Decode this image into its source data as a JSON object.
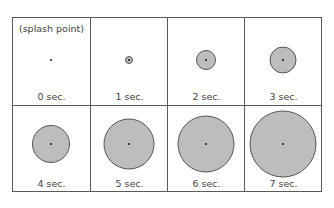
{
  "title_note": "(splash point)",
  "colors": {
    "circle_fill": "#bdbdbd",
    "border": "#5a5a5a",
    "dot": "#111111"
  },
  "cells": [
    {
      "label": "0 sec.",
      "diameter": 0
    },
    {
      "label": "1 sec.",
      "diameter": 8
    },
    {
      "label": "2 sec.",
      "diameter": 20
    },
    {
      "label": "3 sec.",
      "diameter": 27
    },
    {
      "label": "4 sec.",
      "diameter": 38
    },
    {
      "label": "5 sec.",
      "diameter": 51
    },
    {
      "label": "6 sec.",
      "diameter": 57
    },
    {
      "label": "7 sec.",
      "diameter": 67
    }
  ]
}
